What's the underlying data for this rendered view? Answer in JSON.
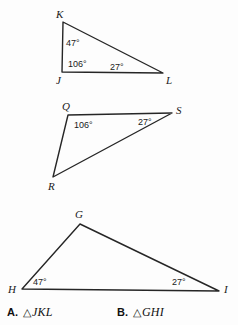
{
  "figure": {
    "background_color": "#fdfdfd",
    "stroke_color": "#262626",
    "text_color": "#1a1a1a",
    "triangles": [
      {
        "id": "triangle-jkl",
        "vertices": [
          {
            "label": "K",
            "x": 63,
            "y": 22,
            "label_x": 56,
            "label_y": 18
          },
          {
            "label": "J",
            "x": 62,
            "y": 72,
            "label_x": 56,
            "label_y": 84
          },
          {
            "label": "L",
            "x": 163,
            "y": 73,
            "label_x": 166,
            "label_y": 84
          }
        ],
        "angles": [
          {
            "label": "47°",
            "at": "K",
            "x": 66,
            "y": 46
          },
          {
            "label": "106°",
            "at": "J",
            "x": 68,
            "y": 67
          },
          {
            "label": "27°",
            "at": "L",
            "x": 110,
            "y": 70
          }
        ]
      },
      {
        "id": "triangle-qrs",
        "vertices": [
          {
            "label": "Q",
            "x": 68,
            "y": 115,
            "label_x": 62,
            "label_y": 110
          },
          {
            "label": "S",
            "x": 172,
            "y": 113,
            "label_x": 176,
            "label_y": 114
          },
          {
            "label": "R",
            "x": 53,
            "y": 177,
            "label_x": 48,
            "label_y": 190
          }
        ],
        "angles": [
          {
            "label": "106°",
            "at": "Q",
            "x": 74,
            "y": 128
          },
          {
            "label": "27°",
            "at": "S",
            "x": 138,
            "y": 125
          }
        ]
      },
      {
        "id": "triangle-ghi",
        "vertices": [
          {
            "label": "G",
            "x": 80,
            "y": 224,
            "label_x": 75,
            "label_y": 218
          },
          {
            "label": "H",
            "x": 22,
            "y": 289,
            "label_x": 8,
            "label_y": 293
          },
          {
            "label": "I",
            "x": 219,
            "y": 291,
            "label_x": 224,
            "label_y": 293
          }
        ],
        "angles": [
          {
            "label": "47°",
            "at": "H",
            "x": 33,
            "y": 285
          },
          {
            "label": "27°",
            "at": "I",
            "x": 172,
            "y": 285
          }
        ]
      }
    ]
  },
  "answers": {
    "choice_a": {
      "letter": "A.",
      "triangle_glyph": "△",
      "name": "JKL"
    },
    "choice_b": {
      "letter": "B.",
      "triangle_glyph": "△",
      "name": "GHI"
    }
  }
}
